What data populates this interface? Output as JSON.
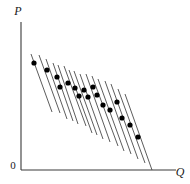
{
  "figure": {
    "width": 190,
    "height": 184,
    "background_color": "#ffffff"
  },
  "axes": {
    "y_axis": {
      "label": "P",
      "x": 21,
      "y_top": 22,
      "y_bottom": 170,
      "color": "#3a3a3a",
      "width": 1.1
    },
    "x_axis": {
      "label": "Q",
      "y": 170,
      "x_left": 21,
      "x_right": 176,
      "color": "#3a3a3a",
      "width": 1.1
    },
    "origin": {
      "label": "0",
      "x": 13,
      "y": 169
    },
    "label_positions": {
      "y_label_x": 18,
      "y_label_y": 15,
      "x_label_x": 180,
      "x_label_y": 176
    }
  },
  "style": {
    "curve_color": "#4a4a4a",
    "curve_width": 0.9,
    "point_color": "#000000",
    "point_radius": 2.6,
    "axis_color": "#3a3a3a",
    "text_color": "#1a1a1a"
  },
  "chart_data": {
    "type": "scatter",
    "title": "",
    "subtitle": "",
    "xlabel": "Q",
    "ylabel": "P",
    "xlim": [
      0,
      190
    ],
    "ylim": [
      0,
      184
    ],
    "grid": false,
    "legend": null,
    "annotations": [],
    "tick_labels": {
      "x": [
        "0"
      ],
      "y": [
        "0"
      ]
    },
    "series": [
      {
        "name": "equilibrium points",
        "marker": "filled-circle",
        "points": [
          {
            "x": 34,
            "y": 63
          },
          {
            "x": 47,
            "y": 70
          },
          {
            "x": 57,
            "y": 77
          },
          {
            "x": 60,
            "y": 87
          },
          {
            "x": 68,
            "y": 83
          },
          {
            "x": 75,
            "y": 88
          },
          {
            "x": 79,
            "y": 96
          },
          {
            "x": 84,
            "y": 90
          },
          {
            "x": 88,
            "y": 97
          },
          {
            "x": 93,
            "y": 87
          },
          {
            "x": 97,
            "y": 95
          },
          {
            "x": 103,
            "y": 105
          },
          {
            "x": 110,
            "y": 110
          },
          {
            "x": 117,
            "y": 102
          },
          {
            "x": 122,
            "y": 118
          },
          {
            "x": 130,
            "y": 125
          },
          {
            "x": 138,
            "y": 137
          }
        ]
      },
      {
        "name": "demand curves",
        "marker": "line-segment",
        "segments": [
          {
            "x1": 31,
            "y1": 54,
            "x2": 52,
            "y2": 112
          },
          {
            "x1": 39,
            "y1": 55,
            "x2": 60,
            "y2": 113
          },
          {
            "x1": 46,
            "y1": 59,
            "x2": 67,
            "y2": 119
          },
          {
            "x1": 53,
            "y1": 63,
            "x2": 73,
            "y2": 121
          },
          {
            "x1": 58,
            "y1": 65,
            "x2": 78,
            "y2": 124
          },
          {
            "x1": 64,
            "y1": 66,
            "x2": 86,
            "y2": 126
          },
          {
            "x1": 69,
            "y1": 70,
            "x2": 92,
            "y2": 133
          },
          {
            "x1": 74,
            "y1": 71,
            "x2": 97,
            "y2": 135
          },
          {
            "x1": 80,
            "y1": 74,
            "x2": 103,
            "y2": 139
          },
          {
            "x1": 86,
            "y1": 74,
            "x2": 110,
            "y2": 142
          },
          {
            "x1": 92,
            "y1": 76,
            "x2": 118,
            "y2": 146
          },
          {
            "x1": 98,
            "y1": 79,
            "x2": 124,
            "y2": 151
          },
          {
            "x1": 105,
            "y1": 81,
            "x2": 131,
            "y2": 154
          },
          {
            "x1": 111,
            "y1": 84,
            "x2": 138,
            "y2": 159
          },
          {
            "x1": 118,
            "y1": 89,
            "x2": 145,
            "y2": 163
          },
          {
            "x1": 125,
            "y1": 94,
            "x2": 152,
            "y2": 170
          }
        ]
      }
    ]
  }
}
